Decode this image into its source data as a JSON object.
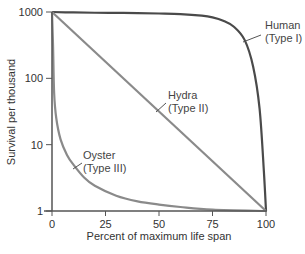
{
  "chart_data": {
    "type": "line",
    "title": "",
    "xlabel": "Percent of maximum life span",
    "ylabel": "Survival per thousand",
    "xlim": [
      0,
      100
    ],
    "ylim": [
      1,
      1000
    ],
    "yscale": "log",
    "grid": false,
    "legend": "none (direct curve annotations)",
    "x_ticks": [
      0,
      25,
      50,
      75,
      100
    ],
    "x_tick_labels": [
      "0",
      "25",
      "50",
      "75",
      "100"
    ],
    "y_ticks": [
      1,
      10,
      100,
      1000
    ],
    "y_tick_labels": [
      "1",
      "10",
      "100",
      "1000"
    ],
    "series": [
      {
        "name": "Human (Type I)",
        "label_line1": "Human",
        "label_line2": "(Type I)",
        "color": "#4a4a4a",
        "x": [
          0,
          10,
          20,
          30,
          40,
          50,
          60,
          70,
          75,
          80,
          85,
          90,
          94,
          97,
          99,
          100
        ],
        "y": [
          1000,
          985,
          975,
          970,
          965,
          950,
          930,
          880,
          830,
          740,
          600,
          380,
          150,
          35,
          4,
          1
        ]
      },
      {
        "name": "Hydra (Type II)",
        "label_line1": "Hydra",
        "label_line2": "(Type II)",
        "color": "#8a8a8a",
        "x": [
          0,
          100
        ],
        "y": [
          1000,
          1
        ]
      },
      {
        "name": "Oyster (Type III)",
        "label_line1": "Oyster",
        "label_line2": "(Type III)",
        "color": "#8a8a8a",
        "x": [
          0,
          0.5,
          1,
          2,
          4,
          7,
          10,
          15,
          20,
          30,
          40,
          50,
          60,
          75,
          100
        ],
        "y": [
          1000,
          300,
          60,
          25,
          12,
          7,
          5,
          3.2,
          2.4,
          1.7,
          1.4,
          1.25,
          1.15,
          1.05,
          1
        ]
      }
    ],
    "annotations": [
      {
        "text": "Human (Type I)",
        "series": "Human (Type I)"
      },
      {
        "text": "Hydra (Type II)",
        "series": "Hydra (Type II)"
      },
      {
        "text": "Oyster (Type III)",
        "series": "Oyster (Type III)"
      }
    ]
  },
  "layout": {
    "plot": {
      "x0": 52,
      "x1": 266,
      "y_top": 12,
      "y_bottom": 211
    },
    "axis_color": "#555555",
    "label_positions": {
      "Human (Type I)": {
        "tx": 265,
        "ty": 29,
        "lx1": 243,
        "ly1": 42,
        "lx2": 261,
        "ly2": 35
      },
      "Hydra (Type II)": {
        "tx": 168,
        "ty": 99,
        "lx1": 156,
        "ly1": 112,
        "lx2": 166,
        "ly2": 103
      },
      "Oyster (Type III)": {
        "tx": 83,
        "ty": 159,
        "lx1": 73,
        "ly1": 169,
        "lx2": 82,
        "ly2": 163
      }
    }
  }
}
